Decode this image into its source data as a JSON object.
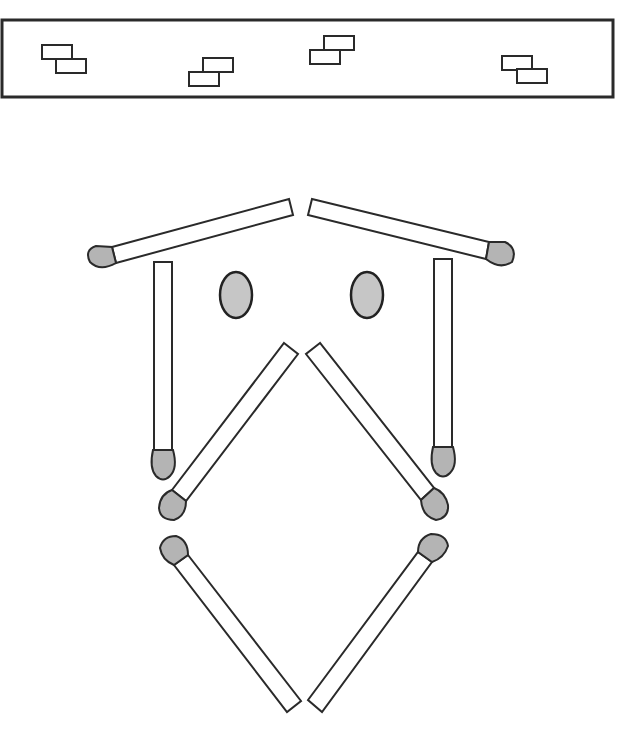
{
  "puzzle": {
    "type": "matchstick-puzzle",
    "description": "Matchstick figure shaped like a face/owl; box at top contains loose bricks",
    "colors": {
      "stick_fill": "#ffffff",
      "outline": "#2a2a2a",
      "match_head": "#b4b4b4",
      "eye": "#c6c6c6"
    },
    "top_box": {
      "brick_pairs": 4
    },
    "matchsticks": [
      {
        "id": "roof-left",
        "orientation": "diagonal",
        "head": "left"
      },
      {
        "id": "roof-right",
        "orientation": "diagonal",
        "head": "right"
      },
      {
        "id": "side-left",
        "orientation": "vertical",
        "head": "bottom"
      },
      {
        "id": "side-right",
        "orientation": "vertical",
        "head": "bottom"
      },
      {
        "id": "inner-upper-left",
        "orientation": "diagonal",
        "head": "bottom-left"
      },
      {
        "id": "inner-upper-right",
        "orientation": "diagonal",
        "head": "bottom-right"
      },
      {
        "id": "lower-left",
        "orientation": "diagonal",
        "head": "top-left"
      },
      {
        "id": "lower-right",
        "orientation": "diagonal",
        "head": "top-right"
      }
    ],
    "eyes": 2
  }
}
